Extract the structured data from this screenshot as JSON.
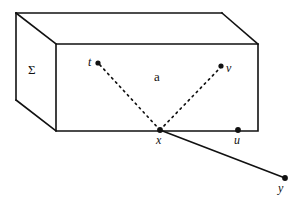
{
  "figure": {
    "background_color": "#ffffff",
    "stroke_color": "#111111",
    "labels": {
      "sigma": "Σ",
      "region": "a",
      "point_t": "t",
      "point_v": "v",
      "point_x": "x",
      "point_u": "u",
      "point_y": "y"
    },
    "geometry": {
      "front_face": [
        [
          56,
          44
        ],
        [
          258,
          44
        ],
        [
          258,
          131
        ],
        [
          56,
          131
        ]
      ],
      "top_back_edge": [
        [
          16,
          13
        ],
        [
          222,
          13
        ]
      ],
      "left_back_edge": [
        [
          16,
          13
        ],
        [
          16,
          100
        ]
      ],
      "left_bottom_diagonal": [
        [
          16,
          100
        ],
        [
          56,
          131
        ]
      ],
      "top_left_diagonal": [
        [
          16,
          13
        ],
        [
          56,
          44
        ]
      ],
      "top_right_diagonal": [
        [
          222,
          13
        ],
        [
          258,
          44
        ]
      ],
      "dashed_t_to_x": [
        [
          98,
          63
        ],
        [
          160,
          130
        ]
      ],
      "dashed_v_to_x": [
        [
          222,
          66
        ],
        [
          160,
          130
        ]
      ],
      "solid_x_to_y": [
        [
          160,
          130
        ],
        [
          285,
          178
        ]
      ],
      "dots": {
        "t": [
          98,
          63
        ],
        "v": [
          222,
          66
        ],
        "x": [
          160,
          130
        ],
        "u": [
          238,
          130
        ],
        "y": [
          285,
          178
        ]
      }
    }
  }
}
